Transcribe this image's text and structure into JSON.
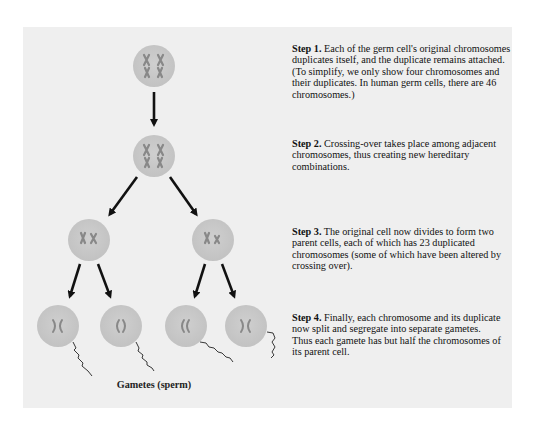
{
  "figure": {
    "background_color": "#efefef",
    "cell_color": "#c9c9c9",
    "chromosome_color": "#8a8a8a",
    "arrow_color": "#111111"
  },
  "steps": [
    {
      "label": "Step 1.",
      "text": " Each of the germ cell's original chromosomes duplicates itself, and the duplicate remains attached. (To simplify, we only show four chromosomes and their duplicates. In human germ cells, there are 46 chromosomes.)"
    },
    {
      "label": "Step 2.",
      "text": " Crossing-over takes place among adjacent chromosomes, thus creating new hereditary combinations."
    },
    {
      "label": "Step 3.",
      "text": " The original cell now divides to form two parent cells, each of which has 23 duplicated chromosomes (some of which have been altered by crossing over)."
    },
    {
      "label": "Step 4.",
      "text": " Finally, each chromosome and its duplicate now split and segregate into separate gametes. Thus each gamete has but half the chromosomes of its parent cell."
    }
  ],
  "caption": "Gametes (sperm)",
  "cells": {
    "germ_cell": {
      "chromosome_glyph": "XX XX"
    },
    "crossing_over_cell": {
      "chromosome_glyph": "XX XX"
    },
    "parent_cells": [
      "Xx",
      "Xx"
    ],
    "gametes": [
      ")(",
      "()",
      "((",
      ")("
    ]
  }
}
